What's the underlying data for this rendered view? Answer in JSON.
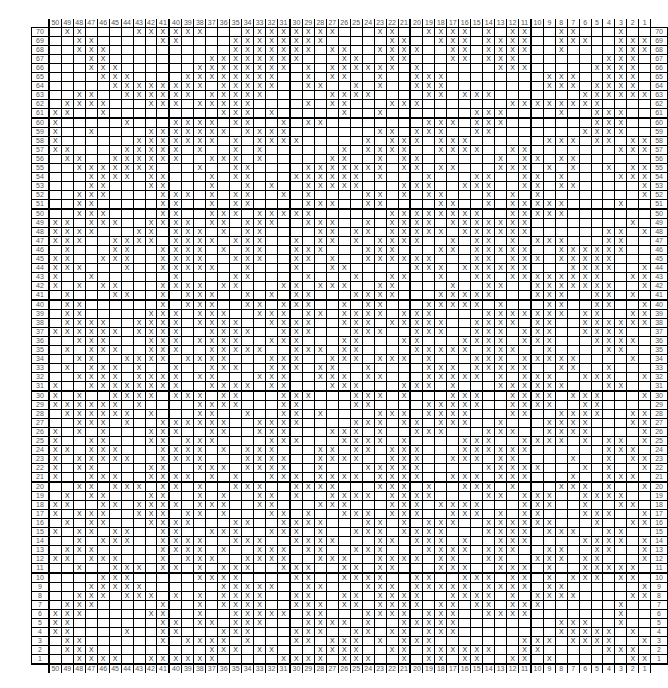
{
  "chart_data": {
    "type": "table",
    "title": "",
    "columns": 50,
    "rows": 70,
    "column_labels_order": "50 to 1 (left to right)",
    "row_labels_order": "70 to 1 (top to bottom)",
    "symbol": "X",
    "heavy_gridline_every": 10,
    "grid": [
      ".XX....XXXXXX...XXXXXXXX...XX..XXXX.X.XX..XX...X..",
      "..XX.....XX....XXXXXXXX.....XX..XXX.XXXX..XXX..XXX.",
      "..XXX..........XXXXXXX.XX..XXXX..XX.XXXX..X....XXX.X",
      "...XX........XXXXXXXX...XX..XX...XX.XXX.......XXX.X.",
      "...XXX......XXXXXXXX.X.XXXXXX.X......XXX.....XXXX...",
      "....XXX....XXXXXXXX..X.XX..X..XXX........XXX..XXX...",
      ".....XXXXXXXX.XXXXX..XX..X.X..XXX........XXX.XXXX...",
      "..XX..XXXXXX.XXXXX.....XXXX....XX.XXX.......XXXXXXXX.",
      ".XXXX...XXX.XXXXX....X.XX...XXX.......XXXXXXXX......",
      "XX..X.........XXX.X.....X..X.......XXX....X..XXX....",
      "X.....X...XXXX.XX..X.XX........XXX.XXX.......XXX....",
      "X..X....XXXXXXX.XXXX.......XX.XXX..XX.......XXXX..XX",
      "X......XXXXXXX.X.XXXX.....X.XXX.XXX......XXX.XX.XXX.",
      "XX....XXXXX.X..X.X......X.XXXX..XXXX..XX.......XXX.X",
      ".XX..XXXXXX..XXX.X.....XX..X.XX......X.XX.XX......XX",
      "..XXXXXXX...X..XX....XXXXXXX.XX.XX...XXX.X.X..X.XXX.",
      "...XXXX.XX...X.XX...XXXXXX.X...X...XX..XX.X....XXXXX",
      "...XX...XX...X..X.X..XXXXX...XXX..XXX..XX.XX.....XX",
      "..XXX....XXX.X.XX..X.X....XX.X.XX...X.X.X........XXX",
      "..XX.....XX..X.XX....XXX..XX....XX..X.XXXXX....X..X.",
      "..XXX....XX..XXX.XXXXX......XXXXXXXX..XXXXX........",
      "XX.XXX..XXXX.XX.XXX..XXX..X.XXXX.XXXXXXX........X..X",
      "XXXX...XX.XXX.X.XX....XX.XX.XXXXX.XXXXXX......XX.XX.",
      "XXX..XXXX.XXXX.XXX..X.XX.X.XXXX..X.XX.X.XXX...XX....",
      ".X...XX..XXXX.X.XX..XXX...XXX...XX.XXXXX..XXXXXX....",
      "XX..XXX..XXXX..XXX..XX.X..XXXXXX...XX.XXX.XXXXX.....",
      "XXX...X..XXXXX..X...X..XX.....XXX.XXXXXX...XXXX..XX",
      "X..X......X....XX....X...X..XX..X..XX.XXXXXXXX..XX.",
      "X.X.XX...XXXX.XX...XX.XXX..XX....X..XX..XXXXXXX..XX",
      ".X...XX..X.XXX..X.X.XX...XXXX...XXXXX...XXX..XX.X.",
      ".XX......X.XXX..XX.XXX..X.XX...XXXXX.X...XX..XX..X.",
      ".XX.....XXX.XXX..XXX.XX.XXXX.XXX....XXXXXXX.XX..XX.",
      ".XXXX..XXXX.XXXX..XXXX..XXX.XXXXX..XXXX.XX..XXXXXXX",
      "XXXXXX.XXXX..XXXX..XXX...XXX..XXX..XXX.XXX..XXXX..X",
      "..XXX...XXX.XXXX..XXX...XX...XX...XXXX.XXX...XXXX..",
      ".X.XXX..XXX..XXXXX..XXX.XX....XXXXX.XXX..X....XX..X",
      "..XX..XXXX.XXXX...XXX..XXX.XXX.X...XXX.XXXXX....X..",
      ".X.XXX.X..X..XXX..XXX.XX..X....XXX.XXXXX..XX..X....",
      "..XXXX.XXXX.XX...XXX..XXX.XX...XXXXX.X.XXX..XXX..X.",
      "X..XXXXXXXX..XXXX.XX...XXX...XXX.X...XXXXXX...XX..X",
      "X.X..XXXX.XXX.XX...XXX...XXX.X...XXX..XXXX.XXX...XX",
      "XXXXXX.X....XXXX...XX....XX....XXXXX..XXXX..XX....X",
      ".XXXXXX.X...XX..X..XX.X....XXX.XXXX...XX..XXXX..XX.",
      "..XXX.X..XXXXXX..XXXX....XXX.XX.XXX..X...XXXX...XXX",
      "X.X.X...XXX..XX..XXX...XXX.X..XXX...XXX..XXXX....XX",
      "X..XX...XX.XXX....XXX...XXXX.X....XXX..XXXX.X.XX.X.",
      "XX.XXX...XXXX.X.XXX...XX.XX.XXX...XXXXXX......XXX.X",
      "X.XXXXX..XXXX...XXXX..XXXX..XXX..XXX.XX....X..X.XX.",
      "X.XX....XX..XXX.XXXX..X...XXXXX.....XXXXX...X.X..XX",
      "X..XXX..XXXX.X.X..XXX.XXXX.XXXX..XXX.XXX...X..XXX.X",
      "..XX.XXX.XX.X..XXX..XXXX...XXX.X..XXX.X...XXX.X..X.",
      ".X.XX...XX..X.X..XX.X..XXXX.XXXX....XX.XXX..XXXX..X",
      "XX..XX.XXXX.XXX..XX...XXX...XXX.XXXX...XXX..X..XX.X",
      "X.XXX..XXX.XX.X...XX.X..XXX.XXX..XXX.X.XX...XXX..X.",
      ".X.XX...XXXX...XX..XXXX...XX.X.XXX..XXXXXX...X..XXX",
      "X.XX.XX..XX..XXX..XXX.X..XXX.XXXX...XXXX.XXX..XX..X",
      "..X.XXX..XXXX..XXX..XXXX...XX.XXX.X..XXX....XXXX.X.",
      ".XXX.....XXXX.X..XXX.XX..XXX...XXXX.XXX..XX..XX..XX",
      "XX.XXX...X.XXX..XXXX..XXX..XXXX.XX..XX..XXX.XX...X.",
      "..X..XXX.XX.X.XXX..XXX..XX.XX...XXX..XXX.X..XXXXX..",
      "....XXX.....XXXX....XX..XXXX..XX..XXX.XX.X.XXX.XX..",
      "...XXXXX......XXXXX..XX...XXX.XXXXX.XXXX.XX......XX",
      "..XXX.XXX.X.X.XXXX..XX..XX.XXXX..XXXX.X.XXXX....XX.",
      ".XXX.....X..X.XXXX..XXX.XX.XXXX.XX.XX.XXX......X...",
      "XXX.....XX..X..XXXXX.XX...XXXX.XXX..XXXX.......X...",
      "XX.......XX.XX.XXX...XXXX.X..XXXXX........XXX..X...",
      "XX....X..XX...XXX...XXX..XX.XX.XXX........XXXXX.X..",
      ".XX......X.XXXX.X...XX.XXX.X.XXX.......XXX.XXXX..X.",
      ".XXX.........XXX.XX...XXXX..XX.XXXXXX..XX.....XXX..X",
      "..XXXX..XXXXXX.....XXXX.XXX..X.XX.XX..XX.X......XX.."
    ]
  },
  "header": {
    "column_labels": [
      "50",
      "49",
      "48",
      "47",
      "46",
      "45",
      "44",
      "43",
      "42",
      "41",
      "40",
      "39",
      "38",
      "37",
      "36",
      "35",
      "34",
      "33",
      "32",
      "31",
      "30",
      "29",
      "28",
      "27",
      "26",
      "25",
      "24",
      "23",
      "22",
      "21",
      "20",
      "19",
      "18",
      "17",
      "16",
      "15",
      "14",
      "13",
      "12",
      "11",
      "10",
      "9",
      "8",
      "7",
      "6",
      "5",
      "4",
      "3",
      "2",
      "1"
    ]
  }
}
